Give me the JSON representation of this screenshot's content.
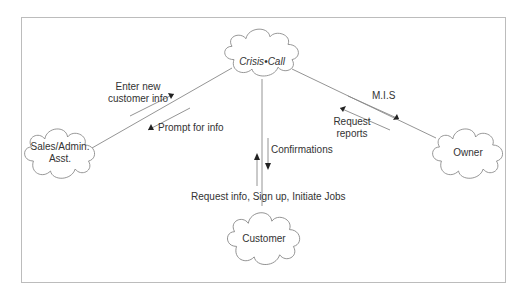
{
  "nodes": {
    "crisis_call": {
      "label_a": "Crisis",
      "sep": "•",
      "label_b": "Call"
    },
    "sales": {
      "line1": "Sales/Admin.",
      "line2": "Asst."
    },
    "owner": {
      "label": "Owner"
    },
    "customer": {
      "label": "Customer"
    }
  },
  "flows": {
    "sales_to_cc": {
      "line1": "Enter new",
      "line2": "customer info"
    },
    "cc_to_sales": {
      "label": "Prompt for info"
    },
    "cc_to_owner": {
      "label": "M.I.S"
    },
    "owner_to_cc": {
      "line1": "Request",
      "line2": "reports"
    },
    "cc_to_customer": {
      "label": "Confirmations"
    },
    "customer_to_cc": {
      "label": "Request info, Sign up, Initiate Jobs"
    }
  },
  "colors": {
    "line": "#888888",
    "text": "#333333",
    "frame": "#bcbcbc"
  }
}
